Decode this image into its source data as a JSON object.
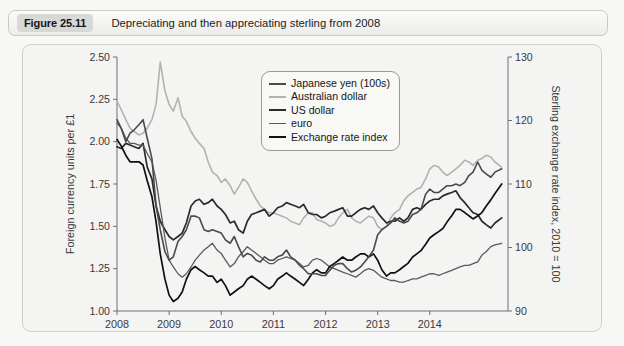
{
  "caption": {
    "figure_number": "Figure 25.11",
    "title": "Depreciating and then appreciating sterling from 2008"
  },
  "colors": {
    "panel_bg": "#f4f4f2",
    "page_bg": "#f7f7f5",
    "axis": "#6e6e70",
    "text": "#3a3a3e",
    "japanese_yen": "#4a4a4e",
    "australian_dollar": "#b2b2b0",
    "us_dollar": "#2a2a2e",
    "euro": "#5a5a5e",
    "exchange_rate_index": "#111114"
  },
  "legend": {
    "items": [
      {
        "label": "Japanese yen (100s)",
        "color": "#4a4a4e",
        "width": 1.6
      },
      {
        "label": "Australian dollar",
        "color": "#b2b2b0",
        "width": 1.6
      },
      {
        "label": "US dollar",
        "color": "#2a2a2e",
        "width": 1.7
      },
      {
        "label": "euro",
        "color": "#5a5a5e",
        "width": 1.3
      },
      {
        "label": "Exchange rate index",
        "color": "#111114",
        "width": 1.7
      }
    ]
  },
  "chart_data": {
    "type": "line",
    "title": "Depreciating and then appreciating sterling from 2008",
    "xlabel": "",
    "ylabel": "Foreign currency units per £1",
    "y2label": "Sterling exchange rate index, 2010 = 100",
    "xlim": [
      2008.0,
      2015.5
    ],
    "ylim": [
      1.0,
      2.5
    ],
    "y2lim": [
      90,
      130
    ],
    "yticks": [
      "1.00",
      "1.25",
      "1.50",
      "1.75",
      "2.00",
      "2.25",
      "2.50"
    ],
    "ytick_values": [
      1.0,
      1.25,
      1.5,
      1.75,
      2.0,
      2.25,
      2.5
    ],
    "y2ticks": [
      "90",
      "100",
      "110",
      "120",
      "130"
    ],
    "y2tick_values": [
      90,
      100,
      110,
      120,
      130
    ],
    "xticks": [
      "2008",
      "2009",
      "2010",
      "2011",
      "2012",
      "2013",
      "2014"
    ],
    "xtick_values": [
      2008,
      2009,
      2010,
      2011,
      2012,
      2013,
      2014
    ],
    "grid": false,
    "legend_position": "upper-center",
    "series": [
      {
        "name": "Australian dollar",
        "axis": "left",
        "color": "#b2b2b0",
        "width": 1.6,
        "x": [
          2008.0,
          2008.08,
          2008.17,
          2008.25,
          2008.33,
          2008.42,
          2008.5,
          2008.58,
          2008.67,
          2008.75,
          2008.83,
          2008.92,
          2009.0,
          2009.08,
          2009.17,
          2009.25,
          2009.33,
          2009.42,
          2009.5,
          2009.58,
          2009.67,
          2009.75,
          2009.83,
          2009.92,
          2010.0,
          2010.08,
          2010.17,
          2010.25,
          2010.33,
          2010.42,
          2010.5,
          2010.58,
          2010.67,
          2010.75,
          2010.83,
          2010.92,
          2011.0,
          2011.08,
          2011.17,
          2011.25,
          2011.33,
          2011.42,
          2011.5,
          2011.58,
          2011.67,
          2011.75,
          2011.83,
          2011.92,
          2012.0,
          2012.08,
          2012.17,
          2012.25,
          2012.33,
          2012.42,
          2012.5,
          2012.58,
          2012.67,
          2012.75,
          2012.83,
          2012.92,
          2013.0,
          2013.08,
          2013.17,
          2013.25,
          2013.33,
          2013.42,
          2013.5,
          2013.58,
          2013.67,
          2013.75,
          2013.83,
          2013.92,
          2014.0,
          2014.08,
          2014.17,
          2014.25,
          2014.33,
          2014.42,
          2014.5,
          2014.58,
          2014.67,
          2014.75,
          2014.83,
          2014.92,
          2015.0,
          2015.08,
          2015.17,
          2015.25,
          2015.38
        ],
        "y": [
          2.24,
          2.19,
          2.13,
          2.08,
          2.06,
          2.04,
          2.05,
          2.08,
          2.13,
          2.22,
          2.47,
          2.3,
          2.22,
          2.18,
          2.26,
          2.15,
          2.12,
          2.06,
          2.02,
          1.99,
          1.96,
          1.88,
          1.82,
          1.8,
          1.76,
          1.78,
          1.74,
          1.69,
          1.73,
          1.78,
          1.76,
          1.71,
          1.66,
          1.62,
          1.6,
          1.58,
          1.58,
          1.57,
          1.56,
          1.55,
          1.53,
          1.52,
          1.51,
          1.55,
          1.58,
          1.58,
          1.54,
          1.53,
          1.52,
          1.5,
          1.51,
          1.55,
          1.58,
          1.6,
          1.55,
          1.53,
          1.52,
          1.54,
          1.56,
          1.55,
          1.5,
          1.48,
          1.5,
          1.55,
          1.58,
          1.6,
          1.65,
          1.68,
          1.7,
          1.72,
          1.73,
          1.78,
          1.84,
          1.86,
          1.85,
          1.82,
          1.8,
          1.82,
          1.84,
          1.86,
          1.89,
          1.88,
          1.86,
          1.89,
          1.9,
          1.92,
          1.91,
          1.88,
          1.85
        ]
      },
      {
        "name": "US dollar",
        "axis": "left",
        "color": "#2a2a2e",
        "width": 1.7,
        "x": [
          2008.0,
          2008.08,
          2008.17,
          2008.25,
          2008.33,
          2008.42,
          2008.5,
          2008.58,
          2008.67,
          2008.75,
          2008.83,
          2008.92,
          2009.0,
          2009.08,
          2009.17,
          2009.25,
          2009.33,
          2009.42,
          2009.5,
          2009.58,
          2009.67,
          2009.75,
          2009.83,
          2009.92,
          2010.0,
          2010.08,
          2010.17,
          2010.25,
          2010.33,
          2010.42,
          2010.5,
          2010.58,
          2010.67,
          2010.75,
          2010.83,
          2010.92,
          2011.0,
          2011.08,
          2011.17,
          2011.25,
          2011.33,
          2011.42,
          2011.5,
          2011.58,
          2011.67,
          2011.75,
          2011.83,
          2011.92,
          2012.0,
          2012.08,
          2012.17,
          2012.25,
          2012.33,
          2012.42,
          2012.5,
          2012.58,
          2012.67,
          2012.75,
          2012.83,
          2012.92,
          2013.0,
          2013.08,
          2013.17,
          2013.25,
          2013.33,
          2013.42,
          2013.5,
          2013.58,
          2013.67,
          2013.75,
          2013.83,
          2013.92,
          2014.0,
          2014.08,
          2014.17,
          2014.25,
          2014.33,
          2014.42,
          2014.5,
          2014.58,
          2014.67,
          2014.75,
          2014.83,
          2014.92,
          2015.0,
          2015.08,
          2015.17,
          2015.25,
          2015.38
        ],
        "y": [
          1.97,
          1.96,
          1.99,
          1.98,
          1.97,
          1.96,
          1.99,
          1.85,
          1.78,
          1.62,
          1.53,
          1.48,
          1.44,
          1.42,
          1.44,
          1.46,
          1.52,
          1.62,
          1.65,
          1.66,
          1.63,
          1.64,
          1.66,
          1.62,
          1.6,
          1.57,
          1.52,
          1.53,
          1.48,
          1.46,
          1.53,
          1.57,
          1.58,
          1.59,
          1.6,
          1.56,
          1.58,
          1.61,
          1.62,
          1.64,
          1.63,
          1.62,
          1.61,
          1.63,
          1.58,
          1.57,
          1.57,
          1.55,
          1.56,
          1.58,
          1.59,
          1.6,
          1.61,
          1.56,
          1.56,
          1.58,
          1.6,
          1.61,
          1.6,
          1.62,
          1.58,
          1.55,
          1.52,
          1.53,
          1.53,
          1.55,
          1.53,
          1.55,
          1.6,
          1.61,
          1.6,
          1.63,
          1.65,
          1.66,
          1.66,
          1.68,
          1.69,
          1.7,
          1.71,
          1.67,
          1.64,
          1.61,
          1.58,
          1.57,
          1.53,
          1.51,
          1.49,
          1.52,
          1.55
        ]
      },
      {
        "name": "euro",
        "axis": "left",
        "color": "#5a5a5e",
        "width": 1.3,
        "x": [
          2008.0,
          2008.08,
          2008.17,
          2008.25,
          2008.33,
          2008.42,
          2008.5,
          2008.58,
          2008.67,
          2008.75,
          2008.83,
          2008.92,
          2009.0,
          2009.08,
          2009.17,
          2009.25,
          2009.33,
          2009.42,
          2009.5,
          2009.58,
          2009.67,
          2009.75,
          2009.83,
          2009.92,
          2010.0,
          2010.08,
          2010.17,
          2010.25,
          2010.33,
          2010.42,
          2010.5,
          2010.58,
          2010.67,
          2010.75,
          2010.83,
          2010.92,
          2011.0,
          2011.08,
          2011.17,
          2011.25,
          2011.33,
          2011.42,
          2011.5,
          2011.58,
          2011.67,
          2011.75,
          2011.83,
          2011.92,
          2012.0,
          2012.08,
          2012.17,
          2012.25,
          2012.33,
          2012.42,
          2012.5,
          2012.58,
          2012.67,
          2012.75,
          2012.83,
          2012.92,
          2013.0,
          2013.08,
          2013.17,
          2013.25,
          2013.33,
          2013.42,
          2013.5,
          2013.58,
          2013.67,
          2013.75,
          2013.83,
          2013.92,
          2014.0,
          2014.08,
          2014.17,
          2014.25,
          2014.33,
          2014.42,
          2014.5,
          2014.58,
          2014.67,
          2014.75,
          2014.83,
          2014.92,
          2015.0,
          2015.08,
          2015.17,
          2015.25,
          2015.38
        ],
        "y": [
          2.11,
          2.08,
          2.02,
          1.99,
          1.99,
          1.98,
          1.98,
          1.93,
          1.88,
          1.77,
          1.61,
          1.43,
          1.3,
          1.26,
          1.22,
          1.2,
          1.22,
          1.26,
          1.3,
          1.33,
          1.36,
          1.38,
          1.4,
          1.36,
          1.34,
          1.3,
          1.26,
          1.28,
          1.32,
          1.35,
          1.38,
          1.36,
          1.34,
          1.32,
          1.3,
          1.28,
          1.28,
          1.3,
          1.31,
          1.32,
          1.31,
          1.3,
          1.28,
          1.26,
          1.27,
          1.3,
          1.31,
          1.3,
          1.28,
          1.26,
          1.25,
          1.24,
          1.23,
          1.22,
          1.21,
          1.2,
          1.22,
          1.24,
          1.25,
          1.24,
          1.22,
          1.2,
          1.19,
          1.18,
          1.18,
          1.17,
          1.17,
          1.18,
          1.19,
          1.19,
          1.2,
          1.21,
          1.22,
          1.22,
          1.21,
          1.22,
          1.23,
          1.24,
          1.25,
          1.26,
          1.27,
          1.27,
          1.28,
          1.29,
          1.33,
          1.35,
          1.38,
          1.39,
          1.4
        ]
      },
      {
        "name": "Exchange rate index",
        "axis": "right",
        "color": "#111114",
        "width": 1.7,
        "x": [
          2008.0,
          2008.08,
          2008.17,
          2008.25,
          2008.33,
          2008.42,
          2008.5,
          2008.58,
          2008.67,
          2008.75,
          2008.83,
          2008.92,
          2009.0,
          2009.08,
          2009.17,
          2009.25,
          2009.33,
          2009.42,
          2009.5,
          2009.58,
          2009.67,
          2009.75,
          2009.83,
          2009.92,
          2010.0,
          2010.08,
          2010.17,
          2010.25,
          2010.33,
          2010.42,
          2010.5,
          2010.58,
          2010.67,
          2010.75,
          2010.83,
          2010.92,
          2011.0,
          2011.08,
          2011.17,
          2011.25,
          2011.33,
          2011.42,
          2011.5,
          2011.58,
          2011.67,
          2011.75,
          2011.83,
          2011.92,
          2012.0,
          2012.08,
          2012.17,
          2012.25,
          2012.33,
          2012.42,
          2012.5,
          2012.58,
          2012.67,
          2012.75,
          2012.83,
          2012.92,
          2013.0,
          2013.08,
          2013.17,
          2013.25,
          2013.33,
          2013.42,
          2013.5,
          2013.58,
          2013.67,
          2013.75,
          2013.83,
          2013.92,
          2014.0,
          2014.08,
          2014.17,
          2014.25,
          2014.33,
          2014.42,
          2014.5,
          2014.58,
          2014.67,
          2014.75,
          2014.83,
          2014.92,
          2015.0,
          2015.08,
          2015.17,
          2015.25,
          2015.38
        ],
        "y": [
          117.0,
          116.0,
          114.5,
          113.5,
          113.5,
          113.5,
          113.0,
          110.5,
          108.0,
          104.0,
          99.0,
          95.0,
          92.5,
          91.5,
          92.0,
          93.0,
          95.0,
          96.5,
          97.0,
          96.5,
          96.0,
          95.5,
          95.5,
          94.5,
          95.0,
          94.0,
          92.5,
          93.0,
          93.5,
          94.0,
          95.0,
          95.5,
          95.0,
          94.5,
          94.0,
          93.5,
          94.0,
          95.0,
          95.5,
          96.0,
          95.5,
          95.0,
          94.5,
          94.0,
          95.0,
          96.0,
          96.5,
          96.0,
          96.0,
          97.0,
          97.5,
          98.0,
          98.5,
          98.0,
          98.0,
          98.5,
          99.0,
          99.0,
          98.5,
          99.0,
          98.0,
          96.5,
          95.5,
          96.0,
          96.0,
          96.5,
          97.0,
          97.5,
          98.5,
          99.0,
          99.5,
          100.5,
          101.5,
          102.0,
          102.5,
          103.0,
          104.0,
          105.0,
          106.0,
          106.0,
          105.5,
          105.0,
          104.5,
          105.0,
          105.5,
          106.5,
          107.5,
          108.5,
          110.0
        ]
      },
      {
        "name": "Japanese yen (100s)",
        "axis": "left",
        "color": "#4a4a4e",
        "width": 1.6,
        "x": [
          2008.0,
          2008.08,
          2008.17,
          2008.25,
          2008.33,
          2008.42,
          2008.5,
          2008.58,
          2008.67,
          2008.75,
          2008.83,
          2008.92,
          2009.0,
          2009.08,
          2009.17,
          2009.25,
          2009.33,
          2009.42,
          2009.5,
          2009.58,
          2009.67,
          2009.75,
          2009.83,
          2009.92,
          2010.0,
          2010.08,
          2010.17,
          2010.25,
          2010.33,
          2010.42,
          2010.5,
          2010.58,
          2010.67,
          2010.75,
          2010.83,
          2010.92,
          2011.0,
          2011.08,
          2011.17,
          2011.25,
          2011.33,
          2011.42,
          2011.5,
          2011.58,
          2011.67,
          2011.75,
          2011.83,
          2011.92,
          2012.0,
          2012.08,
          2012.17,
          2012.25,
          2012.33,
          2012.42,
          2012.5,
          2012.58,
          2012.67,
          2012.75,
          2012.83,
          2012.92,
          2013.0,
          2013.08,
          2013.17,
          2013.25,
          2013.33,
          2013.42,
          2013.5,
          2013.58,
          2013.67,
          2013.75,
          2013.83,
          2013.92,
          2014.0,
          2014.08,
          2014.17,
          2014.25,
          2014.33,
          2014.42,
          2014.5,
          2014.58,
          2014.67,
          2014.75,
          2014.83,
          2014.92,
          2015.0,
          2015.08,
          2015.17,
          2015.25,
          2015.38
        ],
        "y": [
          2.13,
          2.08,
          2.0,
          2.05,
          2.07,
          2.1,
          2.13,
          2.02,
          1.9,
          1.62,
          1.48,
          1.35,
          1.3,
          1.32,
          1.41,
          1.44,
          1.48,
          1.56,
          1.56,
          1.55,
          1.48,
          1.47,
          1.48,
          1.47,
          1.46,
          1.42,
          1.4,
          1.44,
          1.38,
          1.32,
          1.34,
          1.33,
          1.3,
          1.29,
          1.32,
          1.3,
          1.3,
          1.32,
          1.33,
          1.36,
          1.32,
          1.3,
          1.27,
          1.25,
          1.22,
          1.22,
          1.22,
          1.21,
          1.21,
          1.24,
          1.27,
          1.28,
          1.28,
          1.25,
          1.23,
          1.24,
          1.26,
          1.29,
          1.32,
          1.36,
          1.45,
          1.48,
          1.5,
          1.52,
          1.55,
          1.53,
          1.52,
          1.53,
          1.57,
          1.58,
          1.6,
          1.69,
          1.72,
          1.7,
          1.7,
          1.72,
          1.74,
          1.74,
          1.75,
          1.74,
          1.76,
          1.8,
          1.82,
          1.88,
          1.83,
          1.81,
          1.79,
          1.82,
          1.84
        ]
      }
    ]
  }
}
